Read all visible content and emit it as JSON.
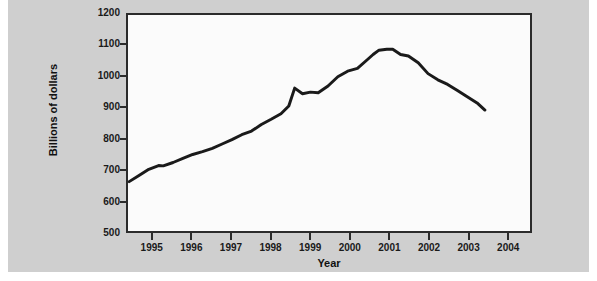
{
  "chart_data": {
    "type": "line",
    "title": "",
    "xlabel": "Year",
    "ylabel": "Billions of dollars",
    "xlim": [
      1994.35,
      2004.6
    ],
    "ylim": [
      500,
      1200
    ],
    "grid": false,
    "legend": null,
    "y_ticks": [
      1200,
      1100,
      1000,
      900,
      800,
      700,
      600,
      500
    ],
    "x_ticks": [
      1995,
      1996,
      1997,
      1998,
      1999,
      2000,
      2001,
      2002,
      2003,
      2004
    ],
    "series": [
      {
        "name": "Billions of dollars",
        "color": "#1a1a1a",
        "line_width": 3,
        "x": [
          1994.38,
          1994.63,
          1994.88,
          1995.13,
          1995.25,
          1995.5,
          1995.75,
          1996.0,
          1996.25,
          1996.5,
          1996.75,
          1997.0,
          1997.25,
          1997.5,
          1997.75,
          1998.0,
          1998.25,
          1998.45,
          1998.6,
          1998.8,
          1999.0,
          1999.2,
          1999.45,
          1999.7,
          1999.95,
          2000.2,
          2000.45,
          2000.6,
          2000.75,
          2000.95,
          2001.1,
          2001.3,
          2001.5,
          2001.75,
          2002.0,
          2002.25,
          2002.5,
          2002.75,
          2003.0,
          2003.25,
          2003.45
        ],
        "y": [
          660,
          680,
          700,
          712,
          711,
          722,
          735,
          748,
          757,
          768,
          782,
          796,
          812,
          824,
          845,
          862,
          880,
          905,
          963,
          945,
          950,
          948,
          970,
          1000,
          1018,
          1027,
          1055,
          1072,
          1086,
          1089,
          1089,
          1072,
          1067,
          1045,
          1010,
          990,
          975,
          955,
          935,
          915,
          892
        ]
      }
    ]
  },
  "axes": {
    "y_title": "Billions of dollars",
    "x_title": "Year",
    "y_tick_labels": [
      "1200",
      "1100",
      "1000",
      "900",
      "800",
      "700",
      "600",
      "500"
    ],
    "x_tick_labels": [
      "1995",
      "1996",
      "1997",
      "1998",
      "1999",
      "2000",
      "2001",
      "2002",
      "2003",
      "2004"
    ]
  },
  "colors": {
    "panel_background": "#cfcfcf",
    "plot_background": "#fbfbfb",
    "axis": "#2b2b2b",
    "line": "#1a1a1a",
    "text": "#111111"
  }
}
